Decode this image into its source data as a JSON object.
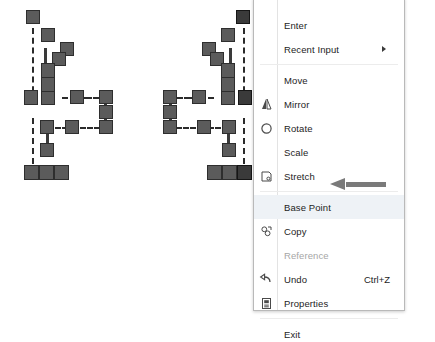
{
  "app": {
    "context": "cad-grip-editing-context-menu"
  },
  "drawing": {
    "name": "grip-edit-preview",
    "description": "Two selected polyline objects shown with square grip handles and dashed construction lines",
    "grip_color": "#5b5b5b",
    "grip_border_color": "#2e2e2e",
    "hot_grip_color": "#3a3a3a",
    "dash_color": "#2b2b2b",
    "shapes": [
      {
        "name": "original-object",
        "grip_count": 17
      },
      {
        "name": "mirrored-object",
        "grip_count": 17
      }
    ]
  },
  "menu": {
    "name": "grip-shortcut-menu",
    "background": "#ffffff",
    "border_color": "#b9b9b9",
    "highlight_color": "#eef2f6",
    "disabled_color": "#a6a6a6",
    "items": [
      {
        "id": "enter",
        "label": "Enter",
        "icon": "",
        "accel": "",
        "enabled": true,
        "selected": false,
        "submenu": false
      },
      {
        "id": "recent-input",
        "label": "Recent Input",
        "icon": "",
        "accel": "",
        "enabled": true,
        "selected": false,
        "submenu": true
      },
      {
        "id": "move",
        "label": "Move",
        "icon": "",
        "accel": "",
        "enabled": true,
        "selected": false,
        "submenu": false
      },
      {
        "id": "mirror",
        "label": "Mirror",
        "icon": "mirror-icon",
        "accel": "",
        "enabled": true,
        "selected": false,
        "submenu": false
      },
      {
        "id": "rotate",
        "label": "Rotate",
        "icon": "rotate-icon",
        "accel": "",
        "enabled": true,
        "selected": false,
        "submenu": false
      },
      {
        "id": "scale",
        "label": "Scale",
        "icon": "",
        "accel": "",
        "enabled": true,
        "selected": false,
        "submenu": false
      },
      {
        "id": "stretch",
        "label": "Stretch",
        "icon": "stretch-icon",
        "accel": "",
        "enabled": true,
        "selected": false,
        "submenu": false
      },
      {
        "id": "base-point",
        "label": "Base Point",
        "icon": "",
        "accel": "",
        "enabled": true,
        "selected": true,
        "submenu": false
      },
      {
        "id": "copy",
        "label": "Copy",
        "icon": "copy-icon",
        "accel": "",
        "enabled": true,
        "selected": false,
        "submenu": false
      },
      {
        "id": "reference",
        "label": "Reference",
        "icon": "",
        "accel": "",
        "enabled": false,
        "selected": false,
        "submenu": false
      },
      {
        "id": "undo",
        "label": "Undo",
        "icon": "undo-icon",
        "accel": "Ctrl+Z",
        "enabled": true,
        "selected": false,
        "submenu": false
      },
      {
        "id": "properties",
        "label": "Properties",
        "icon": "properties-icon",
        "accel": "",
        "enabled": true,
        "selected": false,
        "submenu": false
      },
      {
        "id": "exit",
        "label": "Exit",
        "icon": "",
        "accel": "",
        "enabled": true,
        "selected": false,
        "submenu": false
      }
    ]
  },
  "annotation": {
    "name": "base-point-callout-arrow",
    "points_to": "Base Point",
    "color": "#7a7a7a"
  }
}
